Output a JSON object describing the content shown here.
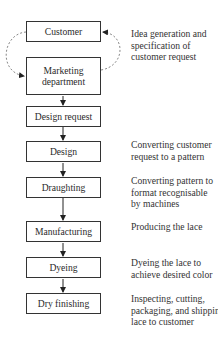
{
  "diagram": {
    "type": "flowchart",
    "steps": [
      {
        "id": "customer",
        "label": "Customer"
      },
      {
        "id": "marketing",
        "label": "Marketing department"
      },
      {
        "id": "design_request",
        "label": "Design request"
      },
      {
        "id": "design",
        "label": "Design"
      },
      {
        "id": "draughting",
        "label": "Draughting"
      },
      {
        "id": "manufacturing",
        "label": "Manufacturing"
      },
      {
        "id": "dyeing",
        "label": "Dyeing"
      },
      {
        "id": "dry_finishing",
        "label": "Dry finishing"
      }
    ],
    "marketing_lines": [
      "Marketing",
      "department"
    ],
    "notes": {
      "idea": [
        "Idea generation and",
        "specification of",
        "customer request"
      ],
      "design": [
        "Converting customer",
        "request to a pattern"
      ],
      "draughting": [
        "Converting pattern to",
        "format recognisable",
        "by machines"
      ],
      "manufacturing": [
        "Producing the lace"
      ],
      "dyeing": [
        "Dyeing the lace to",
        "achieve desired color"
      ],
      "dry_finishing": [
        "Inspecting, cutting,",
        "packaging, and shipping",
        "lace to customer"
      ]
    },
    "edges": [
      {
        "from": "customer",
        "to": "marketing",
        "style": "dashed-curve"
      },
      {
        "from": "marketing",
        "to": "customer",
        "style": "dashed-curve"
      },
      {
        "from": "marketing",
        "to": "design_request",
        "style": "solid"
      },
      {
        "from": "design_request",
        "to": "design",
        "style": "solid"
      },
      {
        "from": "design",
        "to": "draughting",
        "style": "solid"
      },
      {
        "from": "draughting",
        "to": "manufacturing",
        "style": "solid"
      },
      {
        "from": "manufacturing",
        "to": "dyeing",
        "style": "solid"
      },
      {
        "from": "dyeing",
        "to": "dry_finishing",
        "style": "solid"
      }
    ],
    "colors": {
      "stroke": "#333333",
      "dashed": "#888888",
      "text": "#2a2a2a"
    }
  }
}
